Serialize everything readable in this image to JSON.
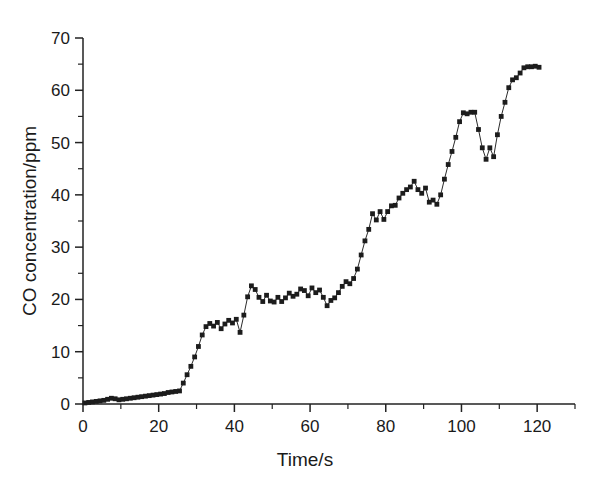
{
  "chart_data": {
    "type": "scatter",
    "title": "",
    "xlabel": "Time/s",
    "ylabel": "CO concentration/ppm",
    "xlim": [
      0,
      130
    ],
    "ylim": [
      0,
      70
    ],
    "xticks": [
      0,
      20,
      40,
      60,
      80,
      100,
      120
    ],
    "xtick_labels": [
      "0",
      "20",
      "40",
      "60",
      "80",
      "100",
      "120"
    ],
    "xminor_step": 10,
    "yticks": [
      0,
      10,
      20,
      30,
      40,
      50,
      60,
      70
    ],
    "ytick_labels": [
      "0",
      "10",
      "20",
      "30",
      "40",
      "50",
      "60",
      "70"
    ],
    "yminor_step": 5,
    "grid": false,
    "legend": null,
    "marker": "square",
    "marker_color": "#1c1c1c",
    "line_color": "#2b2b2b",
    "series": [
      {
        "name": "CO concentration",
        "x": [
          0.5,
          1.5,
          2.5,
          3.5,
          4.5,
          5.5,
          6.5,
          7.5,
          8.5,
          9.5,
          10.5,
          11.5,
          12.5,
          13.5,
          14.5,
          15.5,
          16.5,
          17.5,
          18.5,
          19.5,
          20.5,
          21.5,
          22.5,
          23.5,
          24.5,
          25.5,
          26.5,
          27.5,
          28.5,
          29.5,
          30.5,
          31.5,
          32.5,
          33.5,
          34.5,
          35.5,
          36.5,
          37.5,
          38.5,
          39.5,
          40.5,
          41.5,
          42.5,
          43.5,
          44.5,
          45.5,
          46.5,
          47.5,
          48.5,
          49.5,
          50.5,
          51.5,
          52.5,
          53.5,
          54.5,
          55.5,
          56.5,
          57.5,
          58.5,
          59.5,
          60.5,
          61.5,
          62.5,
          63.5,
          64.5,
          65.5,
          66.5,
          67.5,
          68.5,
          69.5,
          70.5,
          71.5,
          72.5,
          73.5,
          74.5,
          75.5,
          76.5,
          77.5,
          78.5,
          79.5,
          80.5,
          81.5,
          82.5,
          83.5,
          84.5,
          85.5,
          86.5,
          87.5,
          88.5,
          89.5,
          90.5,
          91.5,
          92.5,
          93.5,
          94.5,
          95.5,
          96.5,
          97.5,
          98.5,
          99.5,
          100.5,
          101.5,
          102.5,
          103.5,
          104.5,
          105.5,
          106.5,
          107.5,
          108.5,
          109.5,
          110.5,
          111.5,
          112.5,
          113.5,
          114.5,
          115.5,
          116.5,
          117.5,
          118.5,
          119.5,
          120.5
        ],
        "y": [
          0.2,
          0.3,
          0.4,
          0.5,
          0.6,
          0.7,
          0.9,
          1.1,
          1.0,
          0.8,
          0.9,
          1.0,
          1.1,
          1.2,
          1.3,
          1.4,
          1.5,
          1.6,
          1.7,
          1.8,
          1.9,
          2.0,
          2.2,
          2.3,
          2.4,
          2.5,
          4.0,
          5.6,
          7.2,
          9.0,
          11.0,
          13.2,
          14.8,
          15.4,
          14.9,
          15.6,
          14.4,
          15.3,
          16.0,
          15.5,
          16.2,
          13.7,
          17.0,
          20.5,
          22.6,
          21.9,
          20.4,
          19.6,
          20.8,
          19.7,
          19.5,
          20.4,
          19.6,
          20.3,
          21.2,
          20.6,
          21.0,
          22.0,
          21.7,
          20.7,
          22.2,
          21.3,
          21.8,
          20.4,
          18.8,
          19.8,
          20.3,
          21.3,
          22.5,
          23.4,
          23.0,
          24.0,
          25.8,
          28.5,
          31.2,
          33.4,
          36.4,
          35.2,
          36.8,
          35.3,
          36.8,
          37.9,
          38.0,
          39.4,
          40.3,
          41.0,
          41.5,
          42.6,
          41.0,
          40.3,
          41.3,
          38.6,
          39.0,
          38.2,
          40.0,
          43.0,
          45.8,
          48.3,
          51.0,
          54.0,
          55.7,
          55.5,
          55.8,
          55.8,
          52.5,
          49.0,
          46.8,
          49.0,
          47.3,
          51.5,
          55.0,
          57.7,
          60.5,
          62.0,
          62.4,
          63.3,
          64.3,
          64.5,
          64.5,
          64.6,
          64.4
        ]
      }
    ]
  }
}
